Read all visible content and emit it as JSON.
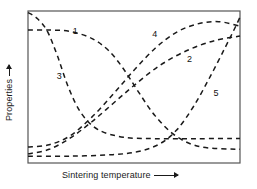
{
  "chart_data": {
    "type": "line",
    "title": "",
    "xlabel": "Sintering temperature",
    "ylabel": "Properties",
    "xlabel_arrow": "right-arrow",
    "ylabel_arrow": "up-arrow",
    "grid": false,
    "legend": "inline-curve-numbers",
    "axis_ticks": "none",
    "axis_numbers": "none",
    "xlim": [
      0,
      1
    ],
    "ylim": [
      0,
      1
    ],
    "line_style": "dashed",
    "line_color": "#1a1a1a",
    "frame_color": "#555555",
    "background": "#ffffff",
    "series": [
      {
        "name": "1",
        "label": "1",
        "label_x": 0.22,
        "label_y": 0.86,
        "description": "starts high and flat, then falls steeply to a low plateau",
        "x": [
          0.0,
          0.1,
          0.2,
          0.3,
          0.38,
          0.45,
          0.52,
          0.6,
          0.7,
          0.82,
          1.0
        ],
        "y": [
          0.875,
          0.875,
          0.865,
          0.82,
          0.74,
          0.62,
          0.47,
          0.31,
          0.175,
          0.105,
          0.09
        ]
      },
      {
        "name": "3",
        "label": "3",
        "label_x": 0.145,
        "label_y": 0.565,
        "description": "starts at top-left, drops very steeply, then flattens to a low plateau",
        "x": [
          0.0,
          0.04,
          0.09,
          0.14,
          0.19,
          0.25,
          0.33,
          0.45,
          0.6,
          0.8,
          1.0
        ],
        "y": [
          0.99,
          0.955,
          0.87,
          0.7,
          0.5,
          0.33,
          0.22,
          0.17,
          0.16,
          0.16,
          0.162
        ]
      },
      {
        "name": "4",
        "label": "4",
        "label_x": 0.595,
        "label_y": 0.845,
        "description": "rises from bottom-left steeply and saturates near the top right",
        "x": [
          0.0,
          0.1,
          0.2,
          0.3,
          0.4,
          0.5,
          0.6,
          0.7,
          0.8,
          0.9,
          1.0
        ],
        "y": [
          0.105,
          0.12,
          0.18,
          0.3,
          0.45,
          0.61,
          0.755,
          0.86,
          0.915,
          0.93,
          0.9
        ]
      },
      {
        "name": "2",
        "label": "2",
        "label_x": 0.76,
        "label_y": 0.675,
        "description": "rises gradually from the bottom-left toward the upper right",
        "x": [
          0.0,
          0.1,
          0.2,
          0.3,
          0.4,
          0.5,
          0.62,
          0.75,
          0.88,
          1.0
        ],
        "y": [
          0.06,
          0.09,
          0.165,
          0.27,
          0.39,
          0.51,
          0.64,
          0.74,
          0.805,
          0.835
        ]
      },
      {
        "name": "5",
        "label": "5",
        "label_x": 0.885,
        "label_y": 0.455,
        "description": "stays low and flat then turns up sharply at high temperature",
        "x": [
          0.0,
          0.2,
          0.4,
          0.52,
          0.62,
          0.7,
          0.78,
          0.86,
          0.93,
          0.98,
          1.0
        ],
        "y": [
          0.045,
          0.045,
          0.055,
          0.075,
          0.125,
          0.215,
          0.37,
          0.57,
          0.76,
          0.9,
          0.96
        ]
      }
    ]
  },
  "figure": {
    "xlabel": "Sintering temperature",
    "ylabel": "Properties"
  }
}
